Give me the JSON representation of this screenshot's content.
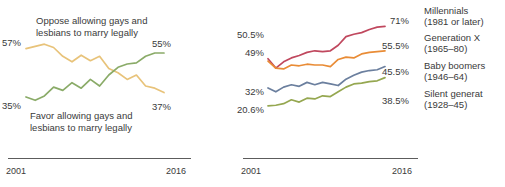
{
  "ghost_text": "figure bleed-through artifact",
  "chart_data": [
    {
      "type": "line",
      "title": "",
      "xlabel": "",
      "ylabel": "",
      "grid": false,
      "legend": "inline-annotations",
      "x": [
        2001,
        2002,
        2003,
        2004,
        2005,
        2006,
        2007,
        2008,
        2009,
        2010,
        2011,
        2012,
        2013,
        2014,
        2015,
        2016
      ],
      "xlim": [
        2001,
        2016
      ],
      "ylim": [
        30,
        60
      ],
      "xticks": [
        "2001",
        "2016"
      ],
      "series": [
        {
          "name": "Oppose allowing gays and lesbians to marry legally",
          "color": "#e8c37a",
          "start_label": "57%",
          "end_label": "37%",
          "values": [
            57,
            58,
            59,
            57.5,
            53.5,
            51,
            54,
            51.5,
            53.5,
            48,
            46,
            43,
            45,
            40,
            39,
            37
          ]
        },
        {
          "name": "Favor allowing gays and lesbians to marry legally",
          "color": "#8aab68",
          "start_label": "35%",
          "end_label": "55%",
          "values": [
            35,
            33.5,
            35.5,
            39.5,
            38,
            41.5,
            39,
            43,
            40,
            45,
            48.5,
            50,
            50.5,
            53.5,
            55,
            55
          ]
        }
      ],
      "annotations": [
        {
          "text": "Oppose allowing gays and\nlesbians to marry legally",
          "near": "oppose-line"
        },
        {
          "text": "Favor allowing gays and\nlesbians to marry legally",
          "near": "favor-line"
        }
      ]
    },
    {
      "type": "line",
      "title": "",
      "xlabel": "",
      "ylabel": "",
      "grid": false,
      "legend": "right",
      "x": [
        2001,
        2002,
        2003,
        2004,
        2005,
        2006,
        2007,
        2008,
        2009,
        2010,
        2011,
        2012,
        2013,
        2014,
        2015,
        2016
      ],
      "xlim": [
        2001,
        2016
      ],
      "ylim": [
        18,
        75
      ],
      "xticks": [
        "2001",
        "2016"
      ],
      "series": [
        {
          "name": "Millennials",
          "cohort": "(1981 or later)",
          "color": "#c0485e",
          "start_label": "50.5%",
          "end_label": "71%",
          "values": [
            50.5,
            44.5,
            48.5,
            51,
            52.5,
            54.5,
            55.5,
            55,
            55.5,
            59,
            64.5,
            66,
            67,
            69,
            70.5,
            71
          ]
        },
        {
          "name": "Generation X",
          "cohort": "(1965–80)",
          "color": "#e98c36",
          "start_label": "49%",
          "end_label": "55.5%",
          "values": [
            49,
            44.5,
            44,
            46.5,
            46,
            47,
            46.5,
            46.5,
            45.5,
            50,
            51.5,
            51,
            53.5,
            54.5,
            55,
            55.5
          ]
        },
        {
          "name": "Baby boomers",
          "cohort": "(1946–64)",
          "color": "#6b7f9e",
          "start_label": "32%",
          "end_label": "45.5%",
          "values": [
            32,
            29.5,
            32.5,
            34,
            33,
            35.5,
            34,
            35.5,
            34.5,
            33.5,
            37.5,
            40,
            42,
            43,
            43.5,
            45.5
          ]
        },
        {
          "name": "Silent generation",
          "cohort": "(1928–45)",
          "color": "#95a750",
          "start_label": "20.6%",
          "end_label": "38.5%",
          "values": [
            20.6,
            21,
            22,
            24.5,
            23,
            25.5,
            25,
            27,
            26.5,
            29.5,
            32.5,
            34.5,
            35,
            36,
            36.5,
            38.5
          ]
        }
      ]
    }
  ],
  "chart1": {
    "labels": {
      "start_oppose": "57%",
      "end_favor": "55%",
      "start_favor": "35%",
      "end_oppose": "37%"
    },
    "annotation_oppose_line1": "Oppose allowing gays and",
    "annotation_oppose_line2": "lesbians to marry legally",
    "annotation_favor_line1": "Favor allowing gays and",
    "annotation_favor_line2": "lesbians to marry legally",
    "axis": {
      "start": "2001",
      "end": "2016"
    }
  },
  "chart2": {
    "labels": {
      "millennials_start": "50.5%",
      "genx_start": "49%",
      "boomers_start": "32%",
      "silent_start": "20.6%",
      "millennials_end": "71%",
      "genx_end": "55.5%",
      "boomers_end": "45.5%",
      "silent_end": "38.5%"
    },
    "legend": [
      {
        "name": "Millennials",
        "cohort": "(1981 or later)"
      },
      {
        "name": "Generation X",
        "cohort": "(1965–80)"
      },
      {
        "name": "Baby boomers",
        "cohort": "(1946–64)"
      },
      {
        "name": "Silent generat",
        "cohort": "(1928–45)"
      }
    ],
    "axis": {
      "start": "2001",
      "end": "2016"
    }
  }
}
